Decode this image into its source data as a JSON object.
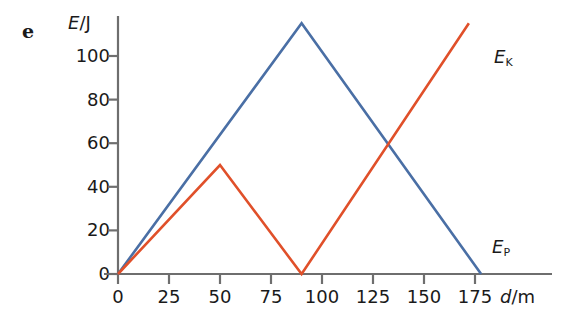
{
  "figure": {
    "part_label": "e",
    "y_axis_title_var": "E",
    "y_axis_title_sep": "/J",
    "x_axis_title_var": "d",
    "x_axis_title_sep": "/m"
  },
  "labels": {
    "ek_var": "E",
    "ek_sub": "K",
    "ep_var": "E",
    "ep_sub": "P"
  },
  "colors": {
    "kinetic": "#e0502a",
    "potential": "#4a6fa5",
    "axis": "#6e6e6e",
    "text": "#1a1a1a"
  },
  "chart_data": {
    "type": "line",
    "title": "",
    "xlabel": "d/m",
    "ylabel": "E/J",
    "xlim": [
      0,
      190
    ],
    "ylim": [
      0,
      118
    ],
    "xticks": [
      0,
      25,
      50,
      75,
      100,
      125,
      150,
      175
    ],
    "yticks": [
      0,
      20,
      40,
      60,
      80,
      100
    ],
    "xticklabels": [
      "0",
      "25",
      "50",
      "75",
      "100",
      "125",
      "150",
      "175"
    ],
    "yticklabels": [
      "0",
      "20",
      "40",
      "60",
      "80",
      "100"
    ],
    "grid": false,
    "legend": "inline-end-labels",
    "series": [
      {
        "name": "E_P",
        "label": "EP",
        "color": "#4a6fa5",
        "points": [
          [
            0,
            0
          ],
          [
            90,
            115
          ],
          [
            178,
            0
          ]
        ]
      },
      {
        "name": "E_K",
        "label": "EK",
        "color": "#e0502a",
        "points": [
          [
            0,
            0
          ],
          [
            50,
            50
          ],
          [
            90,
            0
          ],
          [
            172,
            115
          ]
        ]
      }
    ],
    "annotations": [
      {
        "name": "crossing",
        "x": 133,
        "y": 54
      }
    ]
  }
}
